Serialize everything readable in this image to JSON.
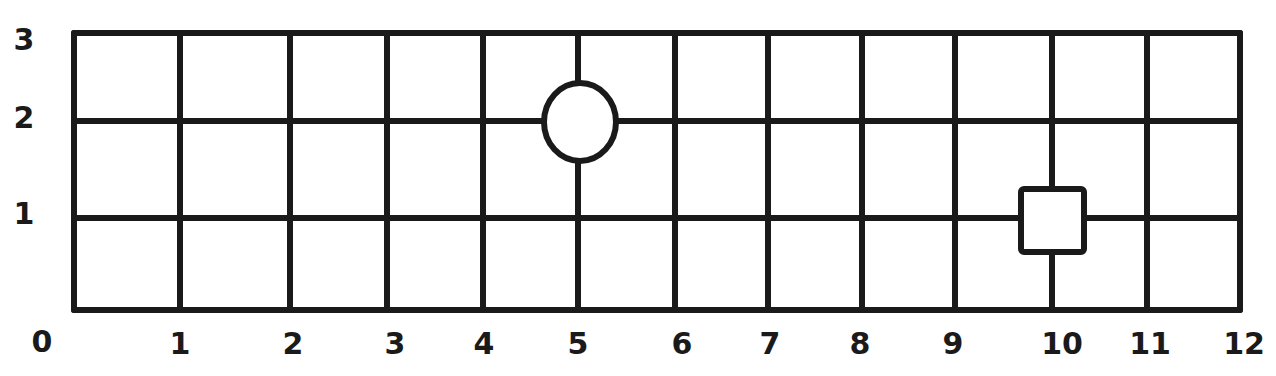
{
  "chart_data": {
    "type": "scatter",
    "title": "",
    "xlabel": "",
    "ylabel": "",
    "xlim": [
      0,
      12
    ],
    "ylim": [
      0,
      3
    ],
    "grid": true,
    "x_ticks": [
      "0",
      "1",
      "2",
      "3",
      "4",
      "5",
      "6",
      "7",
      "8",
      "9",
      "10",
      "11",
      "12"
    ],
    "y_ticks": [
      "0",
      "1",
      "2",
      "3"
    ],
    "points": [
      {
        "name": "circle",
        "shape": "circle",
        "x": 5,
        "y": 2
      },
      {
        "name": "square",
        "shape": "square",
        "x": 10,
        "y": 1
      }
    ],
    "style": "hand-drawn black ink on white"
  },
  "diagram": {
    "origin_label": "0",
    "x_axis_labels": [
      "1",
      "2",
      "3",
      "4",
      "5",
      "6",
      "7",
      "8",
      "9",
      "10",
      "11",
      "12"
    ],
    "y_axis_labels": [
      "1",
      "2",
      "3"
    ],
    "x_line_px": [
      74,
      180,
      290,
      387,
      483,
      578,
      675,
      768,
      862,
      955,
      1052,
      1147,
      1240
    ],
    "y_line_px": [
      310,
      218,
      121,
      33
    ],
    "x_label_px": [
      180,
      293,
      395,
      484,
      578,
      682,
      770,
      860,
      953,
      1062,
      1150,
      1244
    ],
    "y_label_px": [
      310,
      214,
      118,
      40
    ],
    "shapes": [
      {
        "shape": "circle",
        "grid_x": 5,
        "grid_y": 2
      },
      {
        "shape": "square",
        "grid_x": 10,
        "grid_y": 1
      }
    ],
    "colors": {
      "ink": "#1a1a1a",
      "paper": "#ffffff"
    }
  }
}
